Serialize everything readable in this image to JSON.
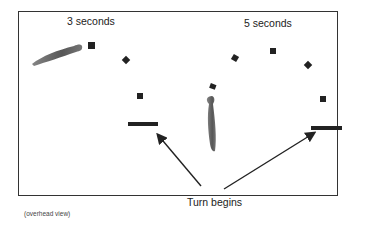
{
  "labels": {
    "left_title": "3 seconds",
    "right_title": "5 seconds",
    "turn": "Turn begins",
    "view": "(overhead view)"
  },
  "colors": {
    "frame": "#333333",
    "marker": "#222222",
    "arrow": "#222222",
    "animal": "#555555"
  },
  "left_panel": {
    "duration": "3 seconds",
    "markers": [
      {
        "shape": "square",
        "x": 92,
        "y": 46
      },
      {
        "shape": "diamond",
        "x": 126,
        "y": 61
      },
      {
        "shape": "square",
        "x": 140,
        "y": 96
      }
    ],
    "turn_bar": {
      "x1": 128,
      "x2": 158,
      "y": 124
    }
  },
  "right_panel": {
    "duration": "5 seconds",
    "markers": [
      {
        "shape": "square",
        "x": 213,
        "y": 88
      },
      {
        "shape": "diamond",
        "x": 235,
        "y": 58
      },
      {
        "shape": "square",
        "x": 273,
        "y": 50
      },
      {
        "shape": "diamond",
        "x": 308,
        "y": 65
      },
      {
        "shape": "square",
        "x": 323,
        "y": 100
      }
    ],
    "turn_bar": {
      "x1": 311,
      "x2": 342,
      "y": 128
    }
  }
}
